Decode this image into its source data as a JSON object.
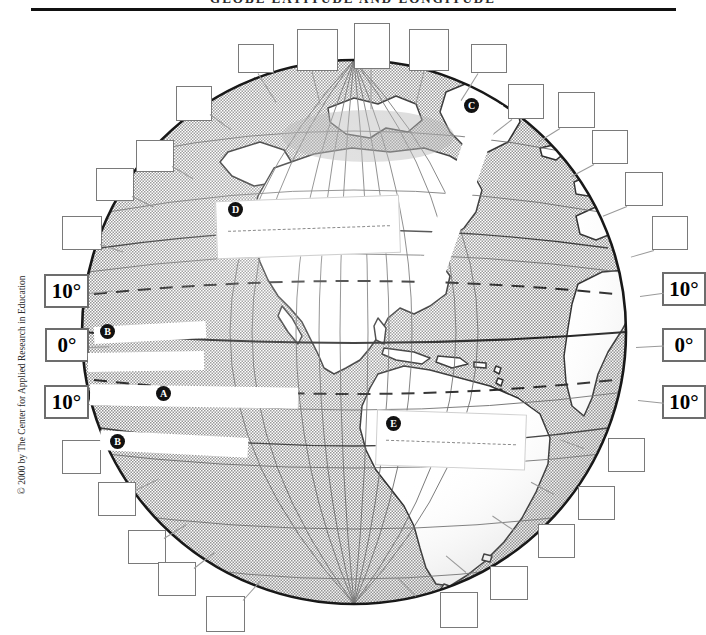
{
  "page": {
    "title": "GLOBE LATITUDE AND LONGITUDE",
    "copyright": "© 2000 by The Center for Applied Research in Education"
  },
  "degree_labels": {
    "left": [
      {
        "name": "left-10-north",
        "value": "10°"
      },
      {
        "name": "left-0-equator",
        "value": "0°"
      },
      {
        "name": "left-10-south",
        "value": "10°"
      }
    ],
    "right": [
      {
        "name": "right-10-north",
        "value": "10°"
      },
      {
        "name": "right-0-equator",
        "value": "0°"
      },
      {
        "name": "right-10-south",
        "value": "10°"
      }
    ]
  },
  "markers": [
    {
      "id": "A",
      "label": "A"
    },
    {
      "id": "B1",
      "label": "B"
    },
    {
      "id": "B2",
      "label": "B"
    },
    {
      "id": "C",
      "label": "C"
    },
    {
      "id": "D",
      "label": "D"
    },
    {
      "id": "E",
      "label": "E"
    }
  ],
  "answer_boxes": [
    {
      "id": 1,
      "value": ""
    },
    {
      "id": 2,
      "value": ""
    },
    {
      "id": 3,
      "value": ""
    },
    {
      "id": 4,
      "value": ""
    },
    {
      "id": 5,
      "value": ""
    },
    {
      "id": 6,
      "value": ""
    },
    {
      "id": 7,
      "value": ""
    },
    {
      "id": 8,
      "value": ""
    },
    {
      "id": 9,
      "value": ""
    },
    {
      "id": 10,
      "value": ""
    },
    {
      "id": 11,
      "value": ""
    },
    {
      "id": 12,
      "value": ""
    },
    {
      "id": 13,
      "value": ""
    },
    {
      "id": 14,
      "value": ""
    },
    {
      "id": 15,
      "value": ""
    },
    {
      "id": 16,
      "value": ""
    },
    {
      "id": 17,
      "value": ""
    },
    {
      "id": 18,
      "value": ""
    },
    {
      "id": 19,
      "value": ""
    },
    {
      "id": 20,
      "value": ""
    },
    {
      "id": 21,
      "value": ""
    },
    {
      "id": 22,
      "value": ""
    }
  ],
  "colors": {
    "ocean": "#c8c8c8",
    "land": "#ffffff",
    "outline": "#3a3a3a",
    "grid": "#6a6a6a",
    "box_border": "#7a7a7a",
    "rule": "#111111"
  }
}
